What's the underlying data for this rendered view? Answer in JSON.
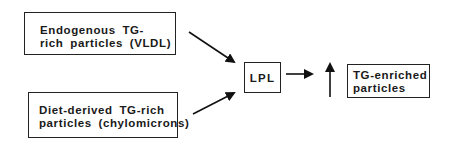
{
  "diagram": {
    "type": "flowchart",
    "nodes": [
      {
        "id": "vldl",
        "lines": [
          "Endogenous TG-",
          "rich particles (VLDL)"
        ]
      },
      {
        "id": "chylo",
        "lines": [
          "Diet-derived TG-rich",
          "particles (chylomicrons)"
        ]
      },
      {
        "id": "lpl",
        "lines": [
          "LPL"
        ]
      },
      {
        "id": "tg_enriched",
        "lines": [
          "TG-enriched",
          "particles"
        ]
      }
    ],
    "edges": [
      {
        "from": "vldl",
        "to": "lpl"
      },
      {
        "from": "chylo",
        "to": "lpl"
      },
      {
        "from": "lpl",
        "to": "increase_indicator"
      }
    ],
    "indicators": [
      {
        "id": "increase_indicator",
        "symbol": "up-arrow",
        "meaning": "increase",
        "applies_to": "tg_enriched"
      }
    ],
    "colors": {
      "stroke": "#222222",
      "text": "#1a1a1a",
      "background": "#ffffff"
    }
  }
}
